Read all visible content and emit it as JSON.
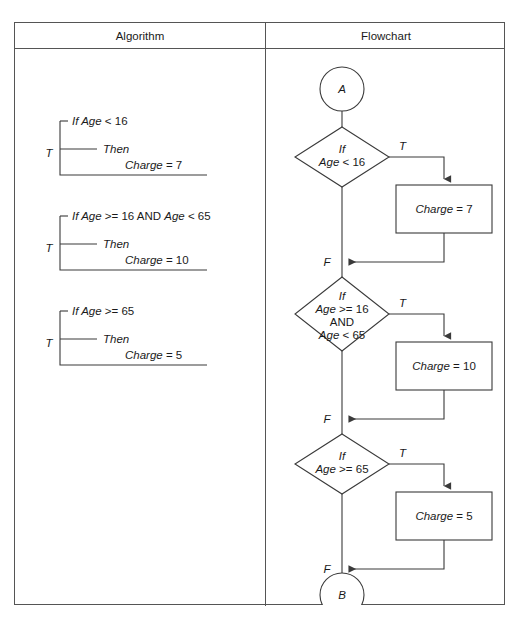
{
  "page": {
    "width": 519,
    "height": 623,
    "background": "#ffffff",
    "line_color": "#3a3a3a",
    "border_color": "#555555",
    "text_color": "#1a1a1a"
  },
  "table": {
    "headers": {
      "algorithm": "Algorithm",
      "flowchart": "Flowchart"
    }
  },
  "algorithm": {
    "blocks": [
      {
        "bracket_label": "T",
        "if_prefix": "If ",
        "if_var": "Age",
        "if_op": " < 16",
        "if_full": "If Age < 16",
        "then_label": "Then",
        "action_var": "Charge",
        "action_op": " = 7",
        "action_full": "Charge = 7"
      },
      {
        "bracket_label": "T",
        "if_prefix": "If ",
        "if_var": "Age",
        "if_op": " >= 16 AND ",
        "if_var2": "Age",
        "if_op2": " < 65",
        "if_full": "If Age >= 16 AND Age < 65",
        "then_label": "Then",
        "action_var": "Charge",
        "action_op": " = 10",
        "action_full": "Charge = 10"
      },
      {
        "bracket_label": "T",
        "if_prefix": "If ",
        "if_var": "Age",
        "if_op": " >= 65",
        "if_full": "If Age >= 65",
        "then_label": "Then",
        "action_var": "Charge",
        "action_op": " = 5",
        "action_full": "Charge = 5"
      }
    ]
  },
  "flowchart": {
    "start_connector": "A",
    "end_connector": "B",
    "decisions": [
      {
        "line1": "If",
        "line2": "Age < 16",
        "line2_var": "Age",
        "line2_op": " < 16",
        "true_label": "T",
        "false_label": "F",
        "process_var": "Charge",
        "process_op": " = 7",
        "process_full": "Charge = 7"
      },
      {
        "line1": "If",
        "line2": "Age >= 16",
        "line2_var": "Age",
        "line2_op": " >= 16",
        "line3": "AND",
        "line4": "Age < 65",
        "line4_var": "Age",
        "line4_op": " < 65",
        "true_label": "T",
        "false_label": "F",
        "process_var": "Charge",
        "process_op": " = 10",
        "process_full": "Charge = 10"
      },
      {
        "line1": "If",
        "line2": "Age >= 65",
        "line2_var": "Age",
        "line2_op": " >= 65",
        "true_label": "T",
        "false_label": "F",
        "process_var": "Charge",
        "process_op": " = 5",
        "process_full": "Charge = 5"
      }
    ]
  }
}
